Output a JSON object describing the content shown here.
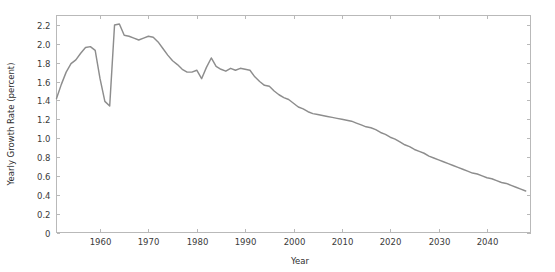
{
  "chart_data": {
    "type": "line",
    "title": "",
    "xlabel": "Year",
    "ylabel": "Yearly Growth Rate (percent)",
    "xlim": [
      1951,
      2049
    ],
    "ylim": [
      0,
      2.3
    ],
    "grid": false,
    "legend": null,
    "line_color": "#8d8d8d",
    "xticks": [
      1960,
      1970,
      1980,
      1990,
      2000,
      2010,
      2020,
      2030,
      2040
    ],
    "xtick_labels": [
      "1960",
      "1970",
      "1980",
      "1990",
      "2000",
      "2010",
      "2020",
      "2030",
      "2040"
    ],
    "yticks": [
      0,
      0.2,
      0.4,
      0.6,
      0.8,
      1.0,
      1.2,
      1.4,
      1.6,
      1.8,
      2.0,
      2.2
    ],
    "ytick_labels": [
      "0",
      "0.2",
      "0.4",
      "0.6",
      "0.8",
      "1.0",
      "1.2",
      "1.4",
      "1.6",
      "1.8",
      "2.0",
      "2.2"
    ],
    "series": [
      {
        "name": "Yearly Growth Rate",
        "x": [
          1951,
          1952,
          1953,
          1954,
          1955,
          1956,
          1957,
          1958,
          1959,
          1960,
          1961,
          1962,
          1963,
          1964,
          1965,
          1966,
          1967,
          1968,
          1969,
          1970,
          1971,
          1972,
          1973,
          1974,
          1975,
          1976,
          1977,
          1978,
          1979,
          1980,
          1981,
          1982,
          1983,
          1984,
          1985,
          1986,
          1987,
          1988,
          1989,
          1990,
          1991,
          1992,
          1993,
          1994,
          1995,
          1996,
          1997,
          1998,
          1999,
          2000,
          2001,
          2002,
          2003,
          2004,
          2005,
          2006,
          2007,
          2008,
          2009,
          2010,
          2011,
          2012,
          2013,
          2014,
          2015,
          2016,
          2017,
          2018,
          2019,
          2020,
          2021,
          2022,
          2023,
          2024,
          2025,
          2026,
          2027,
          2028,
          2029,
          2030,
          2031,
          2032,
          2033,
          2034,
          2035,
          2036,
          2037,
          2038,
          2039,
          2040,
          2041,
          2042,
          2043,
          2044,
          2045,
          2046,
          2047,
          2048
        ],
        "y": [
          1.42,
          1.57,
          1.7,
          1.79,
          1.83,
          1.9,
          1.96,
          1.97,
          1.93,
          1.63,
          1.39,
          1.34,
          2.2,
          2.21,
          2.09,
          2.08,
          2.06,
          2.04,
          2.06,
          2.08,
          2.07,
          2.02,
          1.95,
          1.88,
          1.82,
          1.78,
          1.73,
          1.7,
          1.7,
          1.72,
          1.63,
          1.75,
          1.85,
          1.76,
          1.73,
          1.71,
          1.74,
          1.72,
          1.74,
          1.73,
          1.72,
          1.65,
          1.6,
          1.56,
          1.55,
          1.5,
          1.46,
          1.43,
          1.41,
          1.37,
          1.33,
          1.31,
          1.28,
          1.26,
          1.25,
          1.24,
          1.23,
          1.22,
          1.21,
          1.2,
          1.19,
          1.18,
          1.16,
          1.14,
          1.12,
          1.11,
          1.09,
          1.06,
          1.04,
          1.01,
          0.99,
          0.96,
          0.93,
          0.91,
          0.88,
          0.86,
          0.84,
          0.81,
          0.79,
          0.77,
          0.75,
          0.73,
          0.71,
          0.69,
          0.67,
          0.65,
          0.63,
          0.62,
          0.6,
          0.58,
          0.57,
          0.55,
          0.53,
          0.52,
          0.5,
          0.48,
          0.46,
          0.44
        ]
      }
    ]
  }
}
